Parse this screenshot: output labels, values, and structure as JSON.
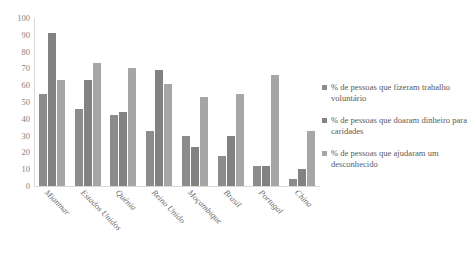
{
  "chart_data": {
    "type": "bar",
    "title": "",
    "subtitle": "",
    "xlabel": "",
    "ylabel": "",
    "ylim": [
      0,
      100
    ],
    "ytick_step": 10,
    "yticks": [
      "100",
      "90",
      "80",
      "70",
      "60",
      "50",
      "40",
      "30",
      "20",
      "10",
      "0"
    ],
    "grid": false,
    "legend_position": "right",
    "categories": [
      "Mianmar",
      "Estados Unidos",
      "Quénia",
      "Reino Unido",
      "Moçambique",
      "Brasil",
      "Portugal",
      "China"
    ],
    "series": [
      {
        "name": "% de pessoas que fizeram trabalho voluntário",
        "color": "#8c8c8c",
        "values": [
          55,
          46,
          42,
          33,
          30,
          18,
          12,
          4
        ]
      },
      {
        "name": "% de pessoas que doaram dinheiro para caridades",
        "color": "#828282",
        "values": [
          91,
          63,
          44,
          69,
          23,
          30,
          12,
          10
        ]
      },
      {
        "name": "% de pessoas que ajudaram um desconhecido",
        "color": "#a6a6a6",
        "values": [
          63,
          73,
          70,
          61,
          53,
          55,
          66,
          33
        ]
      }
    ]
  },
  "legend": {
    "items": [
      {
        "label": "% de pessoas que fizeram trabalho voluntário",
        "color": "#8c8c8c"
      },
      {
        "label": "% de pessoas que doaram dinheiro para caridades",
        "color": "#828282"
      },
      {
        "label": "% de pessoas que ajudaram um desconhecido",
        "color": "#a6a6a6"
      }
    ]
  }
}
